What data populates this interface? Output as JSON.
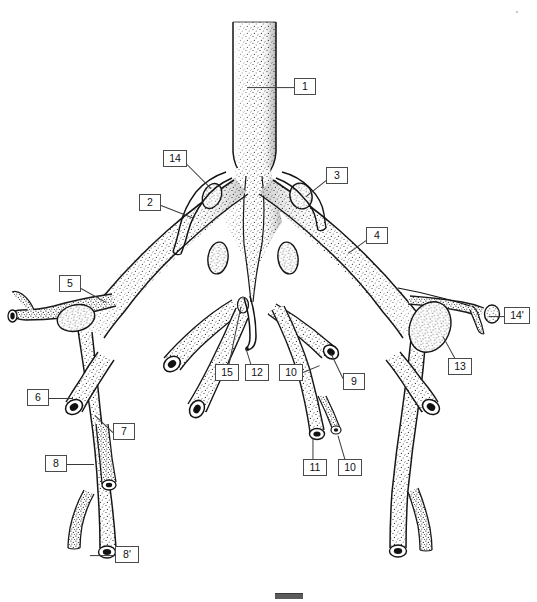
{
  "figure": {
    "kind": "anatomical-line-illustration",
    "style": "stippled pen-and-ink",
    "width": 537,
    "height": 602,
    "background_color": "#ffffff",
    "ink_color": "#111111",
    "leader_color": "#3a3a3a",
    "box_border_color": "#4a4a4a"
  },
  "labels": [
    {
      "id": "1",
      "text": "1",
      "box": {
        "x": 294,
        "y": 78,
        "w": 22,
        "h": 17
      },
      "leader": {
        "x1": 294,
        "y1": 87,
        "x2": 247,
        "y2": 87
      }
    },
    {
      "id": "14",
      "text": "14",
      "box": {
        "x": 163,
        "y": 150,
        "w": 24,
        "h": 17
      },
      "leader": {
        "x1": 187,
        "y1": 164,
        "x2": 211,
        "y2": 188
      }
    },
    {
      "id": "2",
      "text": "2",
      "box": {
        "x": 139,
        "y": 194,
        "w": 22,
        "h": 17
      },
      "leader": {
        "x1": 161,
        "y1": 205,
        "x2": 194,
        "y2": 218
      }
    },
    {
      "id": "3",
      "text": "3",
      "box": {
        "x": 326,
        "y": 167,
        "w": 22,
        "h": 17
      },
      "leader": {
        "x1": 326,
        "y1": 180,
        "x2": 306,
        "y2": 196
      }
    },
    {
      "id": "4",
      "text": "4",
      "box": {
        "x": 366,
        "y": 227,
        "w": 22,
        "h": 17
      },
      "leader": {
        "x1": 366,
        "y1": 240,
        "x2": 348,
        "y2": 253
      }
    },
    {
      "id": "5",
      "text": "5",
      "box": {
        "x": 59,
        "y": 275,
        "w": 22,
        "h": 17
      },
      "leader": {
        "x1": 81,
        "y1": 288,
        "x2": 106,
        "y2": 302
      }
    },
    {
      "id": "6",
      "text": "6",
      "box": {
        "x": 27,
        "y": 389,
        "w": 22,
        "h": 17
      },
      "leader": {
        "x1": 49,
        "y1": 398,
        "x2": 73,
        "y2": 398
      }
    },
    {
      "id": "7",
      "text": "7",
      "box": {
        "x": 113,
        "y": 423,
        "w": 22,
        "h": 17
      },
      "leader": {
        "x1": 113,
        "y1": 432,
        "x2": 95,
        "y2": 415
      }
    },
    {
      "id": "8",
      "text": "8",
      "box": {
        "x": 45,
        "y": 455,
        "w": 22,
        "h": 17
      },
      "leader": {
        "x1": 67,
        "y1": 464,
        "x2": 94,
        "y2": 464
      }
    },
    {
      "id": "8p",
      "text": "8'",
      "box": {
        "x": 115,
        "y": 546,
        "w": 24,
        "h": 17
      },
      "leader": {
        "x1": 115,
        "y1": 555,
        "x2": 90,
        "y2": 555
      }
    },
    {
      "id": "15",
      "text": "15",
      "box": {
        "x": 215,
        "y": 364,
        "w": 24,
        "h": 17
      },
      "leader": {
        "x1": 229,
        "y1": 364,
        "x2": 241,
        "y2": 306
      }
    },
    {
      "id": "12",
      "text": "12",
      "box": {
        "x": 245,
        "y": 364,
        "w": 24,
        "h": 17
      },
      "leader": {
        "x1": 251,
        "y1": 364,
        "x2": 246,
        "y2": 348
      }
    },
    {
      "id": "10a",
      "text": "10",
      "box": {
        "x": 279,
        "y": 364,
        "w": 24,
        "h": 17
      },
      "leader": {
        "x1": 303,
        "y1": 372,
        "x2": 320,
        "y2": 365
      }
    },
    {
      "id": "9",
      "text": "9",
      "box": {
        "x": 343,
        "y": 373,
        "w": 22,
        "h": 17
      },
      "leader": {
        "x1": 343,
        "y1": 378,
        "x2": 331,
        "y2": 353
      }
    },
    {
      "id": "11",
      "text": "11",
      "box": {
        "x": 303,
        "y": 459,
        "w": 24,
        "h": 17
      },
      "leader": {
        "x1": 313,
        "y1": 459,
        "x2": 313,
        "y2": 438
      }
    },
    {
      "id": "10b",
      "text": "10",
      "box": {
        "x": 338,
        "y": 459,
        "w": 24,
        "h": 17
      },
      "leader": {
        "x1": 345,
        "y1": 459,
        "x2": 338,
        "y2": 435
      }
    },
    {
      "id": "13",
      "text": "13",
      "box": {
        "x": 448,
        "y": 358,
        "w": 24,
        "h": 17
      },
      "leader": {
        "x1": 455,
        "y1": 358,
        "x2": 443,
        "y2": 336
      }
    },
    {
      "id": "14p",
      "text": "14'",
      "box": {
        "x": 504,
        "y": 307,
        "w": 26,
        "h": 17
      },
      "leader": {
        "x1": 504,
        "y1": 316,
        "x2": 489,
        "y2": 316
      }
    }
  ],
  "bottom_mark": {
    "present": true,
    "description": "small dark rectangle at bottom center, partially cropped"
  },
  "corner_speck": {
    "present": true,
    "description": "faint speck near top-right corner"
  }
}
